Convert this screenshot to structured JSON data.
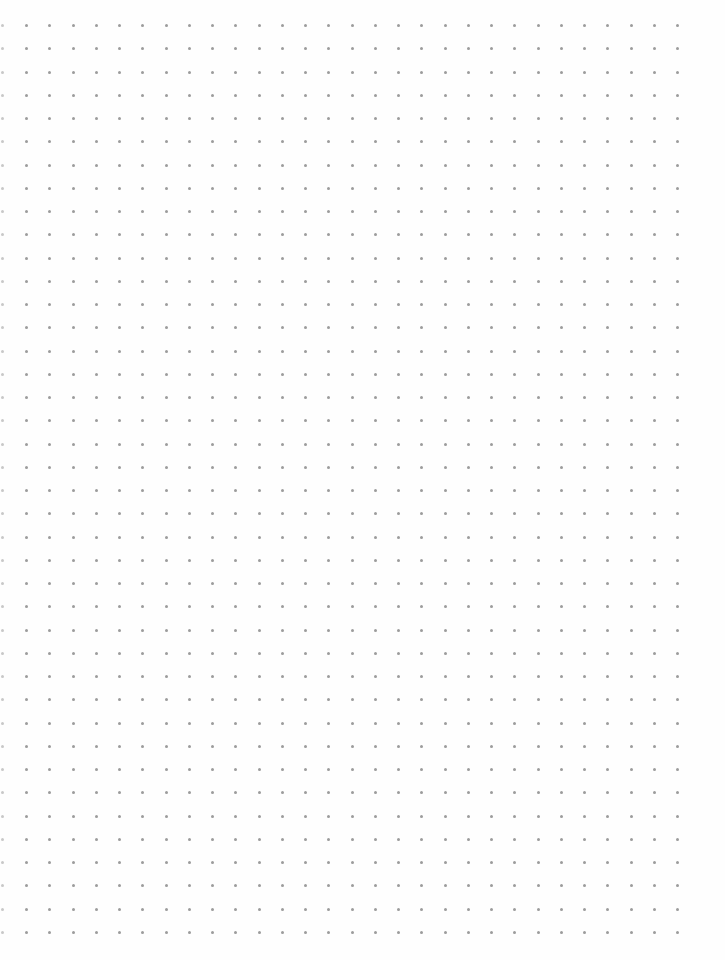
{
  "page": {
    "type": "dot-grid-paper",
    "background": "#fefefe"
  },
  "grid": {
    "dot_color": "#9c9c9c",
    "edge_dot_color": "#c8c8c8",
    "dot_size": 3,
    "origin_x": 26,
    "origin_y": 25,
    "spacing_x": 23.25,
    "spacing_y": 23.25,
    "columns": 29,
    "rows": 40,
    "edge_column_x": 2
  }
}
